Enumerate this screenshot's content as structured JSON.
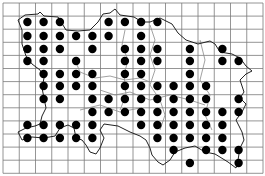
{
  "map": {
    "type": "distribution-grid-map",
    "grid": {
      "columns": 16,
      "rows": 13,
      "x_start": 3,
      "y_start": 3,
      "cell_width": 16.25,
      "cell_height": 13.1,
      "line_color": "#7a7a7a"
    },
    "dot_color": "#000000",
    "coast_color": "#222222",
    "boundary_color": "#8a8a8a",
    "dots": [
      {
        "y": 22,
        "cols": [
          1,
          2,
          3,
          6,
          7,
          8,
          9
        ]
      },
      {
        "y": 36,
        "cols": [
          1,
          2,
          3,
          4,
          5,
          6,
          8
        ]
      },
      {
        "y": 49,
        "cols": [
          1,
          2,
          3,
          5,
          7,
          8,
          9,
          11,
          13
        ]
      },
      {
        "y": 61,
        "cols": [
          1,
          2,
          4,
          7,
          8,
          9,
          11,
          13,
          14
        ]
      },
      {
        "y": 74,
        "cols": [
          2,
          3,
          4,
          5,
          7,
          8,
          11
        ]
      },
      {
        "y": 86,
        "cols": [
          2,
          3,
          4,
          5,
          7,
          8,
          9,
          10,
          11,
          12
        ]
      },
      {
        "y": 99,
        "cols": [
          2,
          3,
          5,
          6,
          7,
          8,
          9,
          10,
          11,
          12,
          14
        ]
      },
      {
        "y": 112,
        "cols": [
          5,
          6,
          7,
          8,
          9,
          10,
          11,
          12,
          13,
          14
        ]
      },
      {
        "y": 125,
        "cols": [
          1,
          2,
          3,
          4,
          5,
          8,
          9,
          10,
          11,
          12,
          13
        ]
      },
      {
        "y": 138,
        "cols": [
          1,
          2,
          3,
          4,
          5,
          9,
          10,
          11,
          12,
          13
        ]
      },
      {
        "y": 150,
        "cols": [
          10,
          12,
          13,
          14
        ]
      },
      {
        "y": 163,
        "cols": [
          11,
          14
        ]
      }
    ]
  }
}
